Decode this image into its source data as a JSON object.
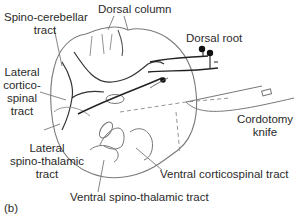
{
  "figure": {
    "panel_label": "(b)",
    "labels": {
      "dorsal_column": "Dorsal column",
      "spino_cerebellar": [
        "Spino-cerebellar",
        "tract"
      ],
      "dorsal_root": "Dorsal root",
      "lateral_corticospinal": [
        "Lateral",
        "cortico-",
        "spinal",
        "tract"
      ],
      "cordotomy_knife": [
        "Cordotomy",
        "knife"
      ],
      "lateral_spinothalamic": [
        "Lateral",
        "spino-thalamic",
        "tract"
      ],
      "ventral_corticospinal": "Ventral corticospinal tract",
      "ventral_spinothalamic": "Ventral spino-thalamic tract"
    },
    "colors": {
      "outline": "#7a7a7a",
      "fiber": "#222222",
      "text": "#2a2a2a"
    }
  }
}
